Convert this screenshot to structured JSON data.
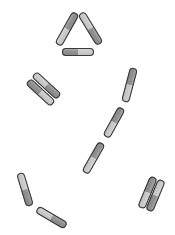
{
  "diagram": {
    "colors": {
      "background": "#ffffff",
      "outline": "#3a3a3a",
      "dark_half": "#8c8c8c",
      "light_half": "#c8c8c8",
      "highlight": "#e4e4e4"
    },
    "rod_width": 8,
    "groups": [
      {
        "name": "triangle-arrangement",
        "rods": [
          {
            "x1": 58,
            "y1": 45,
            "x2": 76,
            "y2": 13,
            "dark_first": false
          },
          {
            "x1": 81,
            "y1": 13,
            "x2": 100,
            "y2": 44,
            "dark_first": false
          },
          {
            "x1": 62,
            "y1": 52,
            "x2": 94,
            "y2": 52,
            "dark_first": true
          }
        ]
      },
      {
        "name": "pair-arrangement-left",
        "rods": [
          {
            "x1": 34,
            "y1": 74,
            "x2": 59,
            "y2": 97,
            "dark_first": false
          },
          {
            "x1": 28,
            "y1": 81,
            "x2": 53,
            "y2": 104,
            "dark_first": true
          }
        ]
      },
      {
        "name": "chain-arrangement",
        "rods": [
          {
            "x1": 134,
            "y1": 68,
            "x2": 125,
            "y2": 102,
            "dark_first": true
          },
          {
            "x1": 122,
            "y1": 108,
            "x2": 106,
            "y2": 137,
            "dark_first": true
          },
          {
            "x1": 102,
            "y1": 143,
            "x2": 85,
            "y2": 173,
            "dark_first": true
          }
        ]
      },
      {
        "name": "l-shape-arrangement",
        "rods": [
          {
            "x1": 20,
            "y1": 173,
            "x2": 30,
            "y2": 206,
            "dark_first": false
          },
          {
            "x1": 37,
            "y1": 209,
            "x2": 66,
            "y2": 226,
            "dark_first": false
          }
        ]
      },
      {
        "name": "pair-arrangement-right",
        "rods": [
          {
            "x1": 154,
            "y1": 177,
            "x2": 141,
            "y2": 208,
            "dark_first": true
          },
          {
            "x1": 162,
            "y1": 180,
            "x2": 149,
            "y2": 211,
            "dark_first": false
          }
        ]
      }
    ]
  }
}
